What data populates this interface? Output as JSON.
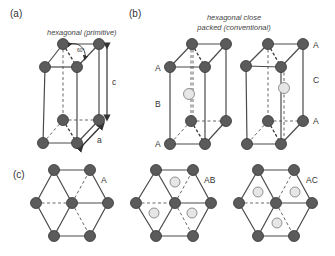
{
  "figure": {
    "panels": {
      "a": {
        "label": "(a)",
        "caption": "hexagonal (primitive)",
        "angle_label": "60°",
        "axis_c": "c",
        "axis_a": "a"
      },
      "b": {
        "label": "(b)",
        "caption_line1": "hexagonal close",
        "caption_line2": "packed (conventional)",
        "cell_ab_layers": [
          "A",
          "B",
          "A"
        ],
        "cell_ac_layers": [
          "A",
          "C",
          "A"
        ]
      },
      "c": {
        "label": "(c)",
        "views": [
          "A",
          "AB",
          "AC"
        ]
      }
    },
    "colors": {
      "atom": "#5b5b5b",
      "interstitial_atom": "#e6e6e6",
      "edge": "#4a4a4a"
    }
  }
}
